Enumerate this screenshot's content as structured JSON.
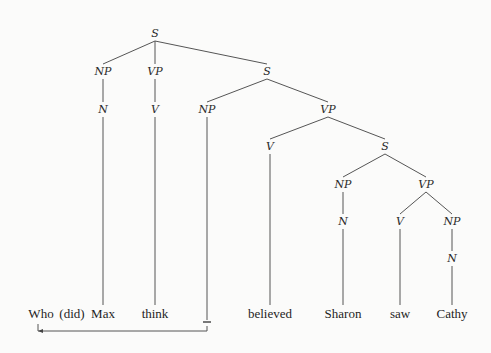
{
  "diagram": {
    "type": "syntax-tree",
    "nodes": [
      {
        "id": "s1",
        "label": "S",
        "x": 155,
        "y": 37
      },
      {
        "id": "np1",
        "label": "NP",
        "x": 103,
        "y": 75
      },
      {
        "id": "vp1",
        "label": "VP",
        "x": 155,
        "y": 75
      },
      {
        "id": "s2",
        "label": "S",
        "x": 267,
        "y": 75
      },
      {
        "id": "n1",
        "label": "N",
        "x": 103,
        "y": 113
      },
      {
        "id": "v1",
        "label": "V",
        "x": 155,
        "y": 113
      },
      {
        "id": "np2",
        "label": "NP",
        "x": 207,
        "y": 113
      },
      {
        "id": "vp2",
        "label": "VP",
        "x": 328,
        "y": 113
      },
      {
        "id": "v2",
        "label": "V",
        "x": 270,
        "y": 150
      },
      {
        "id": "s3",
        "label": "S",
        "x": 385,
        "y": 150
      },
      {
        "id": "np3",
        "label": "NP",
        "x": 343,
        "y": 188
      },
      {
        "id": "vp3",
        "label": "VP",
        "x": 426,
        "y": 188
      },
      {
        "id": "n3",
        "label": "N",
        "x": 343,
        "y": 225
      },
      {
        "id": "v3",
        "label": "V",
        "x": 400,
        "y": 225
      },
      {
        "id": "np4",
        "label": "NP",
        "x": 452,
        "y": 225
      },
      {
        "id": "n4",
        "label": "N",
        "x": 452,
        "y": 262
      }
    ],
    "edges": [
      [
        "s1",
        "np1"
      ],
      [
        "s1",
        "vp1"
      ],
      [
        "s1",
        "s2"
      ],
      [
        "np1",
        "n1"
      ],
      [
        "vp1",
        "v1"
      ],
      [
        "s2",
        "np2"
      ],
      [
        "s2",
        "vp2"
      ],
      [
        "vp2",
        "v2"
      ],
      [
        "vp2",
        "s3"
      ],
      [
        "s3",
        "np3"
      ],
      [
        "s3",
        "vp3"
      ],
      [
        "np3",
        "n3"
      ],
      [
        "vp3",
        "v3"
      ],
      [
        "vp3",
        "np4"
      ],
      [
        "np4",
        "n4"
      ]
    ],
    "words": [
      {
        "text": "Who",
        "x": 41,
        "attach": null
      },
      {
        "text": "(did)",
        "x": 72,
        "attach": null
      },
      {
        "text": "Max",
        "x": 103,
        "attach": "n1"
      },
      {
        "text": "think",
        "x": 155,
        "attach": "v1"
      },
      {
        "text": "_",
        "x": 207,
        "attach": "np2"
      },
      {
        "text": "believed",
        "x": 270,
        "attach": "v2"
      },
      {
        "text": "Sharon",
        "x": 343,
        "attach": "n3"
      },
      {
        "text": "saw",
        "x": 400,
        "attach": "v3"
      },
      {
        "text": "Cathy",
        "x": 452,
        "attach": "n4"
      }
    ],
    "word_baseline_y": 318,
    "movement_arrow": {
      "from_word": "_",
      "to_word": "Who",
      "y": 331
    }
  }
}
